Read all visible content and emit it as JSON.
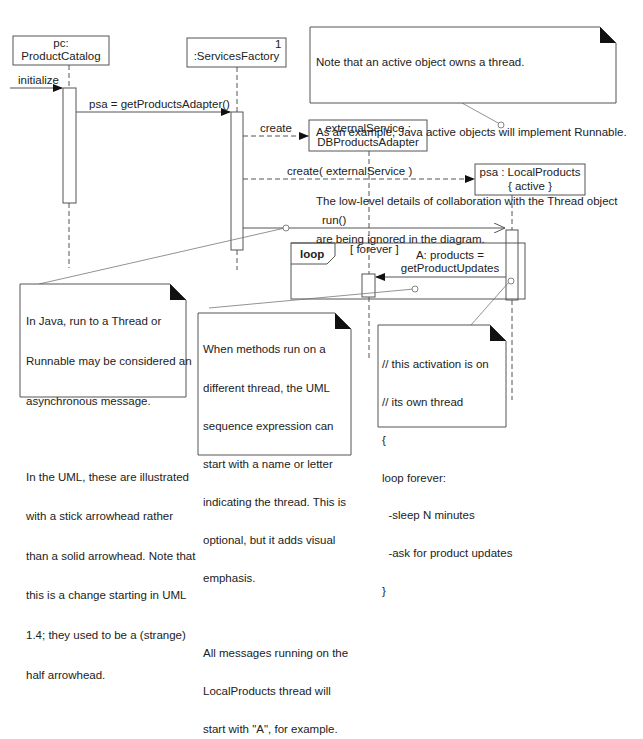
{
  "lifelines": [
    {
      "id": "pc",
      "line1": "pc:",
      "line2": "ProductCatalog"
    },
    {
      "id": "factory",
      "line1": ":ServicesFactory",
      "multiplicity": "1"
    },
    {
      "id": "external",
      "line1": "externalService :",
      "line2": "DBProductsAdapter"
    },
    {
      "id": "psa",
      "line1": "psa : LocalProducts",
      "line2": "{ active }"
    }
  ],
  "messages": {
    "initialize": "initialize",
    "get_adapter": "psa = getProductsAdapter()",
    "create": "create",
    "create_external": "create( externalService )",
    "run": "run()",
    "products_line1": "A: products =",
    "products_line2": "getProductUpdates"
  },
  "fragment": {
    "operator": "loop",
    "guard": "[ forever ]"
  },
  "notes": {
    "active_object": {
      "lines": [
        "Note that an active object owns a thread.",
        "",
        "As an example, Java active objects will implement Runnable.",
        "",
        "The low-level details of collaboration with the Thread object",
        "are being ignored in the diagram."
      ]
    },
    "java_run": {
      "lines": [
        "In Java, run to a Thread or",
        "Runnable may be considered an",
        "asynchronous message.",
        "",
        "In the UML, these are illustrated",
        "with a stick arrowhead rather",
        "than a solid arrowhead. Note that",
        "this is a change starting in UML",
        "1.4; they used to be a (strange)",
        "half arrowhead."
      ]
    },
    "thread_name": {
      "lines": [
        "When methods run on a",
        "different thread, the UML",
        "sequence expression can",
        "start with a name or letter",
        "indicating the thread. This is",
        "optional, but it adds visual",
        "emphasis.",
        "",
        "All messages running on the",
        "LocalProducts thread will",
        "start with \"A\", for example."
      ]
    },
    "activation": {
      "lines": [
        "// this activation is on",
        "// its own thread",
        "{",
        "loop forever:",
        "  -sleep N minutes",
        "  -ask for product updates",
        "}"
      ]
    }
  },
  "colors": {
    "line": "#555555",
    "text": "#222222",
    "background": "#ffffff"
  }
}
